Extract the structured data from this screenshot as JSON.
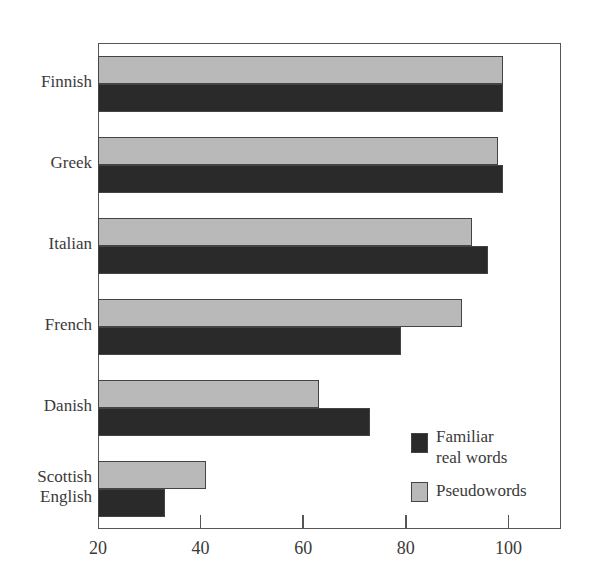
{
  "chart_data": {
    "type": "bar",
    "orientation": "horizontal",
    "title": "",
    "xlabel": "",
    "ylabel": "",
    "categories": [
      "Finnish",
      "Greek",
      "Italian",
      "French",
      "Danish",
      "Scottish English"
    ],
    "category_labels": [
      [
        "Finnish"
      ],
      [
        "Greek"
      ],
      [
        "Italian"
      ],
      [
        "French"
      ],
      [
        "Danish"
      ],
      [
        "Scottish",
        "English"
      ]
    ],
    "series": [
      {
        "name": "Pseudowords",
        "color": "#b9b9b9",
        "values": [
          99,
          98,
          93,
          91,
          63,
          41
        ]
      },
      {
        "name": "Familiar real words",
        "color": "#2a2a2a",
        "values": [
          99,
          99,
          96,
          79,
          73,
          33
        ]
      }
    ],
    "xlim": [
      20,
      110
    ],
    "xticks": [
      20,
      40,
      60,
      80,
      100
    ],
    "grid": false,
    "legend": {
      "position": "lower right inside",
      "entries": [
        {
          "label_lines": [
            "Familiar",
            "real words"
          ],
          "color": "#2a2a2a"
        },
        {
          "label_lines": [
            "Pseudowords"
          ],
          "color": "#b9b9b9"
        }
      ]
    }
  }
}
